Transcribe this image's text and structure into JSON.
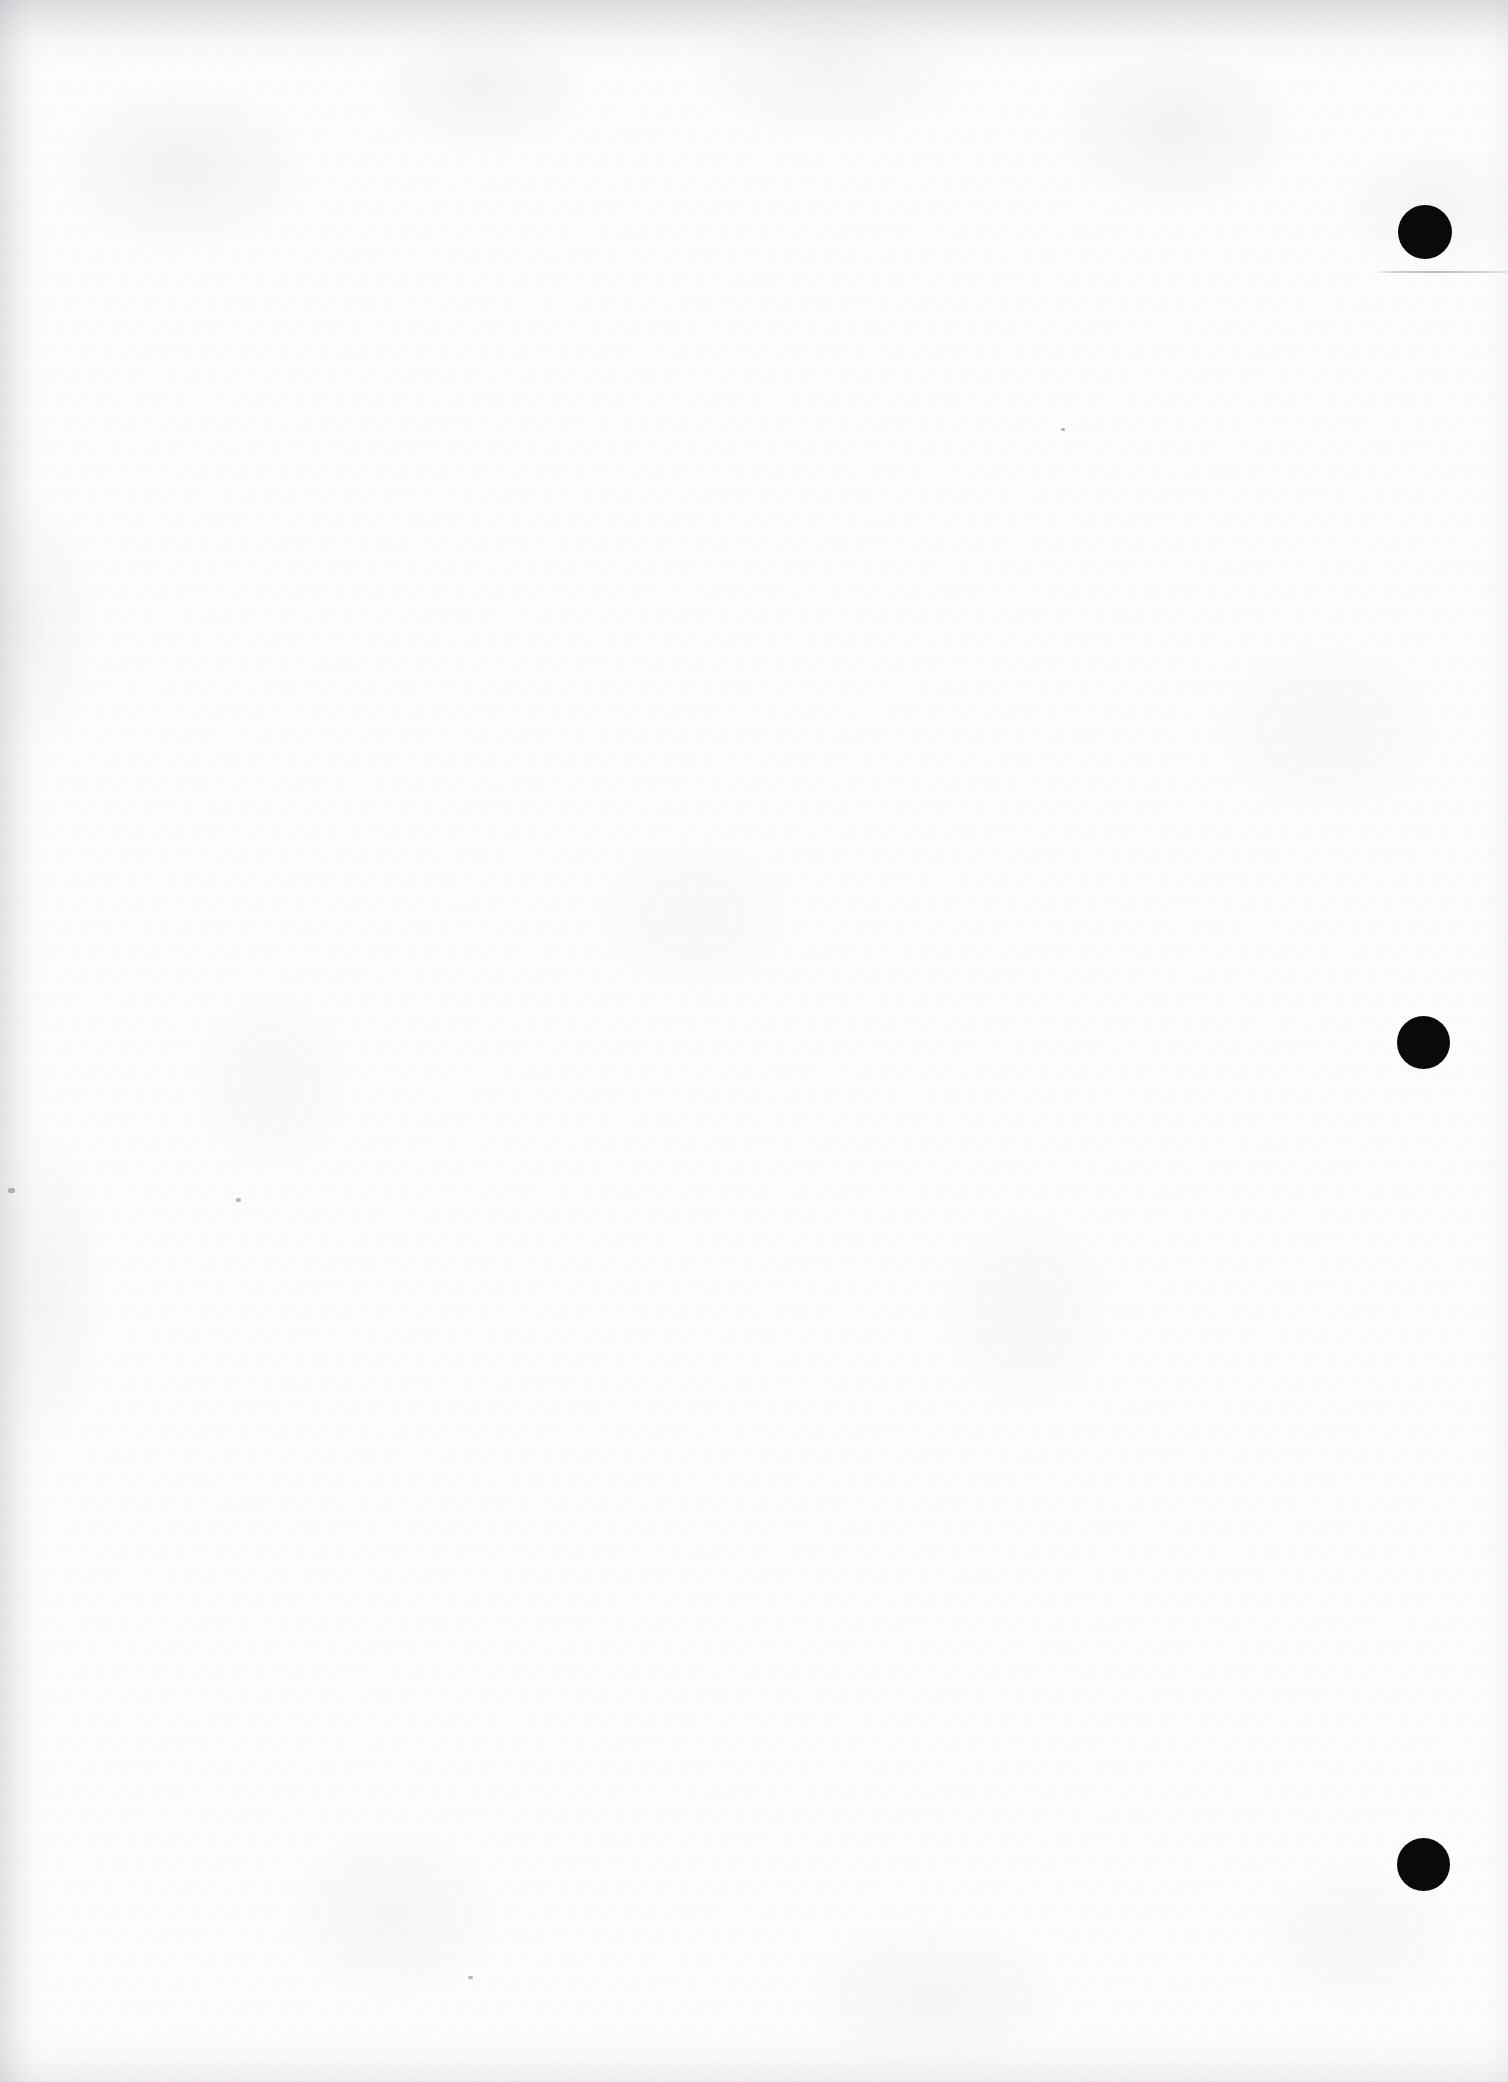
{
  "document": {
    "kind": "scanned-page",
    "page_label": "",
    "body_text": "",
    "width_px": 1508,
    "height_px": 2082,
    "background_color": "#fdfdfd",
    "ink_color": "#0a0a0a",
    "rule_color": "#bdc0c6",
    "edge_shadow_color": "#969aa0"
  },
  "margin_marks": {
    "label": "",
    "count": 3,
    "items": [
      {
        "name": "margin-mark-1",
        "shape": "filled-circle",
        "color": "#0a0a0a",
        "center_x": 1425,
        "center_y": 232,
        "diameter": 54
      },
      {
        "name": "margin-mark-2",
        "shape": "filled-circle",
        "color": "#0a0a0a",
        "center_x": 1423,
        "center_y": 1042,
        "diameter": 53
      },
      {
        "name": "margin-mark-3",
        "shape": "filled-circle",
        "color": "#0a0a0a",
        "center_x": 1423,
        "center_y": 1864,
        "diameter": 53
      }
    ]
  },
  "rules": {
    "items": [
      {
        "name": "margin-rule-1",
        "color": "#bdc0c6",
        "x": 1375,
        "y": 271,
        "width": 133,
        "height": 2
      }
    ]
  },
  "specks": {
    "items": [
      {
        "x": 8,
        "y": 1188,
        "w": 7,
        "h": 5
      },
      {
        "x": 236,
        "y": 1198,
        "w": 5,
        "h": 4
      },
      {
        "x": 1061,
        "y": 428,
        "w": 4,
        "h": 3
      },
      {
        "x": 468,
        "y": 1976,
        "w": 5,
        "h": 3
      }
    ]
  }
}
